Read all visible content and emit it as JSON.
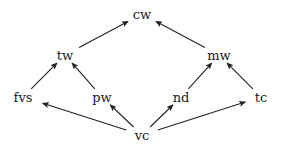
{
  "diagram": {
    "type": "directed-graph",
    "colors": {
      "background": "#ffffff",
      "edge": "#222222",
      "text": "#1a1a1a"
    },
    "nodes": [
      {
        "id": "cw",
        "label": "cw",
        "x": 142,
        "y": 14
      },
      {
        "id": "tw",
        "label": "tw",
        "x": 65,
        "y": 55
      },
      {
        "id": "mw",
        "label": "mw",
        "x": 219,
        "y": 55
      },
      {
        "id": "fvs",
        "label": "fvs",
        "x": 23,
        "y": 97
      },
      {
        "id": "pw",
        "label": "pw",
        "x": 102,
        "y": 97
      },
      {
        "id": "nd",
        "label": "nd",
        "x": 181,
        "y": 97
      },
      {
        "id": "tc",
        "label": "tc",
        "x": 261,
        "y": 97
      },
      {
        "id": "vc",
        "label": "vc",
        "x": 142,
        "y": 135
      }
    ],
    "edges": [
      {
        "from": "tw",
        "to": "cw"
      },
      {
        "from": "mw",
        "to": "cw"
      },
      {
        "from": "fvs",
        "to": "tw"
      },
      {
        "from": "pw",
        "to": "tw"
      },
      {
        "from": "nd",
        "to": "mw"
      },
      {
        "from": "tc",
        "to": "mw"
      },
      {
        "from": "vc",
        "to": "fvs"
      },
      {
        "from": "vc",
        "to": "pw"
      },
      {
        "from": "vc",
        "to": "nd"
      },
      {
        "from": "vc",
        "to": "tc"
      }
    ]
  }
}
